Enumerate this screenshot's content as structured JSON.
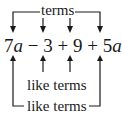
{
  "diagram": {
    "top_label": "terms",
    "expression": {
      "terms": [
        {
          "coef": "7",
          "var": "a"
        },
        {
          "op": "−"
        },
        {
          "coef": "3",
          "var": ""
        },
        {
          "op": "+"
        },
        {
          "coef": "9",
          "var": ""
        },
        {
          "op": "+"
        },
        {
          "coef": "5",
          "var": "a"
        }
      ],
      "text": "7a − 3 + 9 + 5a"
    },
    "middle_label": "like terms",
    "bottom_label": "like terms",
    "color": "#1a1a1a"
  }
}
